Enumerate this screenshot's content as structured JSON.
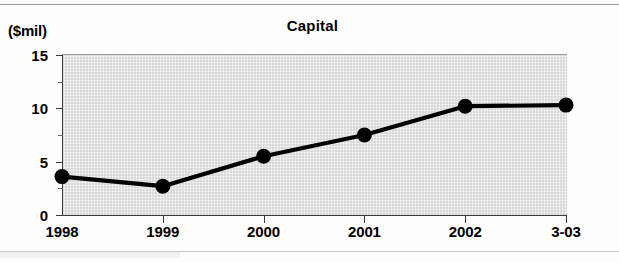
{
  "figure": {
    "unit_label": "($mil)",
    "title": "Capital"
  },
  "chart_data": {
    "type": "line",
    "title": "Capital",
    "subtitle": "",
    "xlabel": "",
    "ylabel": "($mil)",
    "categories": [
      "1998",
      "1999",
      "2000",
      "2001",
      "2002",
      "3-03"
    ],
    "values": [
      3.6,
      2.7,
      5.5,
      7.5,
      10.2,
      10.3
    ],
    "series": [
      {
        "name": "Capital",
        "values": [
          3.6,
          2.7,
          5.5,
          7.5,
          10.2,
          10.3
        ],
        "color": "#000000",
        "marker": "circle"
      }
    ],
    "ylim": [
      0,
      15
    ],
    "yticks": [
      0,
      5,
      10,
      15
    ],
    "ytick_labels": [
      "0",
      "5",
      "10",
      "15"
    ],
    "y_minor_ticks": [
      2.5,
      7.5,
      12.5
    ],
    "xtick_labels": [
      "1998",
      "1999",
      "2000",
      "2001",
      "2002",
      "3-03"
    ],
    "grid": false,
    "legend": "none",
    "plot_background": "#e3e3e3",
    "annotations": []
  }
}
